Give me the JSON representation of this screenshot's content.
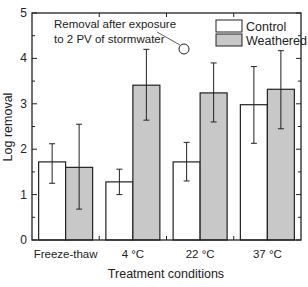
{
  "chart_data": {
    "type": "bar",
    "title": "",
    "xlabel": "Treatment conditions",
    "ylabel": "Log removal",
    "ylim": [
      0,
      5
    ],
    "yticks": [
      0,
      1,
      2,
      3,
      4,
      5
    ],
    "grid": false,
    "legend_position": "upper right",
    "categories": [
      "Freeze-thaw",
      "4 °C",
      "22 °C",
      "37 °C"
    ],
    "series": [
      {
        "name": "Control",
        "color": "#ffffff",
        "values": [
          1.72,
          1.28,
          1.72,
          2.98
        ],
        "error_upper": [
          2.12,
          1.56,
          2.15,
          3.82
        ],
        "error_lower": [
          1.25,
          1.0,
          1.3,
          2.13
        ]
      },
      {
        "name": "Weathered",
        "color": "#c8c8c8",
        "values": [
          1.6,
          3.41,
          3.24,
          3.32
        ],
        "error_upper": [
          2.55,
          4.2,
          3.9,
          4.17
        ],
        "error_lower": [
          0.68,
          2.64,
          2.6,
          2.45
        ]
      }
    ],
    "annotations": [
      {
        "text_line1": "Removal after exposure",
        "text_line2": "to 2 PV of stormwater",
        "points_to": "4 °C Weathered"
      }
    ]
  }
}
